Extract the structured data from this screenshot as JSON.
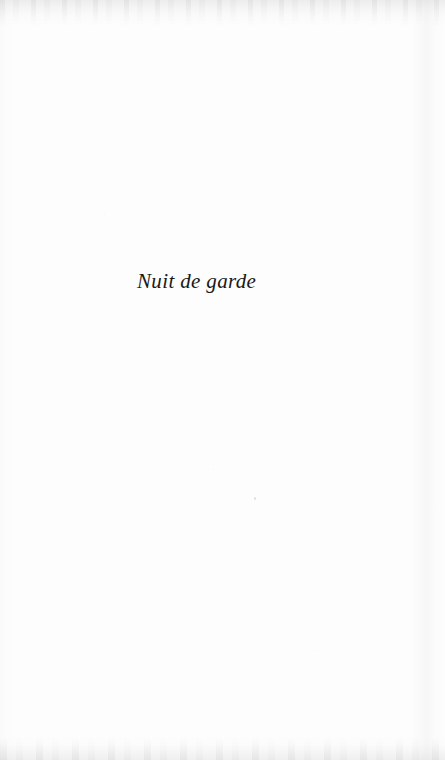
{
  "document": {
    "kind": "scanned-book-page",
    "page_width": 445,
    "page_height": 760,
    "page_background_color": "#fdfdfd",
    "ink_color": "#1a1a1a"
  },
  "content": {
    "part_title": "Nuit de garde"
  },
  "artifacts": {
    "top_edge_band": "",
    "bottom_edge_band": "",
    "right_edge_streak": "",
    "left_edge_shade": ""
  }
}
